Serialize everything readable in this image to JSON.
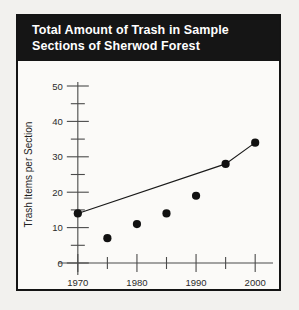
{
  "figure": {
    "title_line1": "Total Amount of Trash in Sample",
    "title_line2": "Sections of Sherwod Forest",
    "border_color": "#141414",
    "title_bg_color": "#151515",
    "title_text_color": "#ffffff",
    "page_bg_color": "#f2f1ee",
    "panel_bg_color": "#fbfaf8"
  },
  "chart_data": {
    "type": "line",
    "title": "Total Amount of Trash in Sample Sections of Sherwod Forest",
    "xlabel": "Year",
    "ylabel": "Trash Items per Section",
    "x": [
      1970,
      1975,
      1980,
      1985,
      1990,
      1995,
      2000
    ],
    "values": [
      14,
      7,
      11,
      14,
      19,
      28,
      34
    ],
    "series": [
      {
        "name": "Trash items per section",
        "values": [
          14,
          7,
          11,
          14,
          19,
          28,
          34
        ]
      }
    ],
    "trend_line_points": [
      {
        "x": 1970,
        "y": 14
      },
      {
        "x": 1995,
        "y": 28
      },
      {
        "x": 2000,
        "y": 34
      }
    ],
    "xlim": [
      1968,
      2002
    ],
    "ylim": [
      0,
      50
    ],
    "xticks": [
      1970,
      1975,
      1980,
      1985,
      1990,
      1995,
      2000
    ],
    "xtick_labels": [
      "1970",
      "",
      "1980",
      "",
      "1990",
      "",
      "2000"
    ],
    "yticks": [
      0,
      5,
      10,
      15,
      20,
      25,
      30,
      35,
      40,
      45,
      50
    ],
    "ytick_labels": [
      "0",
      "",
      "10",
      "",
      "20",
      "",
      "30",
      "",
      "40",
      "",
      "50"
    ],
    "grid": false,
    "legend": "none",
    "marker": "filled-circle",
    "marker_color": "#111111",
    "line_color": "#1a1a1a"
  }
}
